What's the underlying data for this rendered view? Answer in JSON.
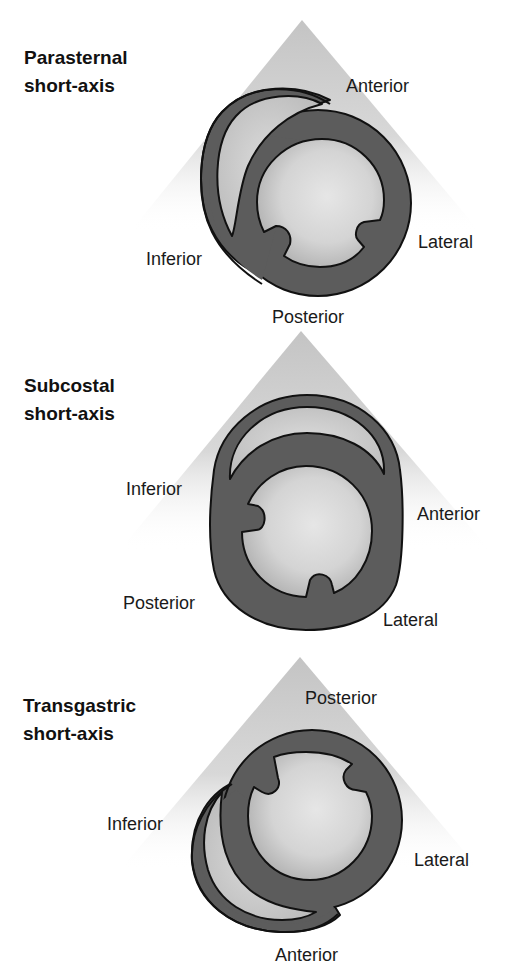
{
  "figure": {
    "colors": {
      "sector": "#c8c8c8",
      "wall": "#5c5c5c",
      "outline": "#111111",
      "cavity_center": "#e4e4e4",
      "cavity_edge": "#b4b4b4",
      "text": "#1a1a1a"
    },
    "panels": [
      {
        "title_line1": "Parasternal",
        "title_line2": "short-axis",
        "labels": {
          "top": "Anterior",
          "right": "Lateral",
          "left": "Inferior",
          "bottom": "Posterior"
        }
      },
      {
        "title_line1": "Subcostal",
        "title_line2": "short-axis",
        "labels": {
          "top_left": "Inferior",
          "right": "Anterior",
          "bottom_left": "Posterior",
          "bottom_right": "Lateral"
        }
      },
      {
        "title_line1": "Transgastric",
        "title_line2": "short-axis",
        "labels": {
          "top": "Posterior",
          "left": "Inferior",
          "right": "Lateral",
          "bottom": "Anterior"
        }
      }
    ]
  }
}
